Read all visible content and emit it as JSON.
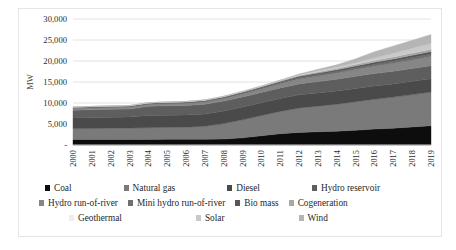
{
  "chart_data": {
    "type": "area",
    "stacked": true,
    "title": "",
    "xlabel": "",
    "ylabel": "MW",
    "ylim": [
      0,
      30000
    ],
    "yticks": [
      0,
      5000,
      10000,
      15000,
      20000,
      25000,
      30000
    ],
    "ytick_labels": [
      "-",
      "5,000",
      "10,000",
      "15,000",
      "20,000",
      "25,000",
      "30,000"
    ],
    "grid": true,
    "grid_axis": "y",
    "legend_position": "bottom",
    "categories": [
      "2000",
      "2001",
      "2002",
      "2003",
      "2004",
      "2005",
      "2006",
      "2007",
      "2008",
      "2009",
      "2010",
      "2011",
      "2012",
      "2013",
      "2014",
      "2015",
      "2016",
      "2017",
      "2018",
      "2019"
    ],
    "series": [
      {
        "name": "Coal",
        "color": "#0d0d0d",
        "values": [
          1300,
          1300,
          1300,
          1300,
          1300,
          1350,
          1350,
          1350,
          1400,
          1700,
          2200,
          2700,
          3000,
          3150,
          3300,
          3500,
          3800,
          4000,
          4300,
          4600
        ]
      },
      {
        "name": "Natural gas",
        "color": "#7a7a7a",
        "values": [
          2600,
          2650,
          2700,
          2750,
          2800,
          2850,
          2900,
          3100,
          3700,
          4300,
          4800,
          5300,
          5800,
          6100,
          6400,
          6800,
          7100,
          7400,
          7700,
          8000
        ]
      },
      {
        "name": "Diesel",
        "color": "#4a4a4a",
        "values": [
          2500,
          2550,
          2600,
          2600,
          2900,
          2900,
          2900,
          2950,
          3000,
          3050,
          3050,
          3100,
          3150,
          3150,
          3150,
          3150,
          3150,
          3150,
          3150,
          3150
        ]
      },
      {
        "name": "Hydro reservoir",
        "color": "#5e5e5e",
        "values": [
          1900,
          1900,
          1900,
          1900,
          2200,
          2250,
          2250,
          2300,
          2350,
          2400,
          2450,
          2500,
          2600,
          2700,
          2800,
          2900,
          2950,
          3000,
          3050,
          3100
        ]
      },
      {
        "name": "Hydro run-of-river",
        "color": "#868686",
        "values": [
          420,
          430,
          440,
          450,
          460,
          470,
          500,
          540,
          600,
          700,
          820,
          980,
          1150,
          1300,
          1450,
          1600,
          1750,
          1900,
          2050,
          2200
        ]
      },
      {
        "name": "Mini hydro run-of-river",
        "color": "#6f6f6f",
        "values": [
          140,
          145,
          150,
          155,
          160,
          165,
          175,
          185,
          200,
          220,
          250,
          290,
          330,
          370,
          410,
          450,
          490,
          530,
          570,
          610
        ]
      },
      {
        "name": "Bio mass",
        "color": "#575757",
        "values": [
          120,
          125,
          130,
          135,
          140,
          145,
          155,
          165,
          180,
          200,
          230,
          270,
          310,
          350,
          390,
          430,
          470,
          510,
          550,
          590
        ]
      },
      {
        "name": "Cogeneration",
        "color": "#a8a8a8",
        "values": [
          80,
          85,
          90,
          95,
          100,
          110,
          120,
          135,
          155,
          180,
          210,
          250,
          300,
          350,
          400,
          450,
          500,
          550,
          600,
          650
        ]
      },
      {
        "name": "Geothermal",
        "color": "#ededed",
        "values": [
          0,
          0,
          0,
          0,
          0,
          0,
          0,
          0,
          0,
          0,
          0,
          0,
          0,
          0,
          0,
          0,
          0,
          0,
          0,
          0
        ]
      },
      {
        "name": "Solar",
        "color": "#c9c9c9",
        "values": [
          0,
          0,
          0,
          0,
          0,
          0,
          0,
          0,
          0,
          0,
          0,
          30,
          120,
          200,
          260,
          330,
          560,
          820,
          1050,
          1300
        ]
      },
      {
        "name": "Wind",
        "color": "#b5b5b5",
        "values": [
          0,
          0,
          0,
          0,
          0,
          0,
          0,
          0,
          0,
          0,
          0,
          20,
          150,
          350,
          550,
          900,
          1450,
          1700,
          1900,
          2100
        ]
      }
    ]
  },
  "legend": {
    "rows": [
      [
        {
          "label": "Coal",
          "series": 0
        },
        {
          "label": "Natural gas",
          "series": 1
        },
        {
          "label": "Diesel",
          "series": 2
        },
        {
          "label": "Hydro reservoir",
          "series": 3
        }
      ],
      [
        {
          "label": "Hydro run-of-river",
          "series": 4
        },
        {
          "label": "Mini hydro run-of-river",
          "series": 5
        },
        {
          "label": "Bio mass",
          "series": 6
        },
        {
          "label": "Cogeneration",
          "series": 7
        }
      ],
      [
        {
          "label": "Geothermal",
          "series": 8
        },
        {
          "label": "Solar",
          "series": 9
        },
        {
          "label": "Wind",
          "series": 10
        }
      ]
    ]
  },
  "style": {
    "grid_color": "#e2e2e2",
    "axis_color": "#d0d0d0",
    "border_color": "#e6e6e6",
    "text_color": "#1f1f1f"
  }
}
